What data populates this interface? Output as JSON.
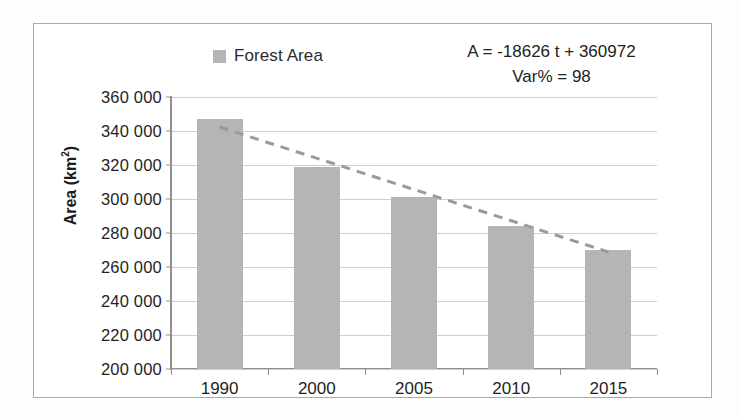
{
  "chart_data": {
    "type": "bar",
    "title": "",
    "xlabel": "",
    "ylabel": "Area (km²)",
    "categories": [
      "1990",
      "2000",
      "2005",
      "2010",
      "2015"
    ],
    "series": [
      {
        "name": "Forest Area",
        "values": [
          347000,
          319000,
          301000,
          284000,
          270000
        ]
      }
    ],
    "trendline": {
      "type": "linear-dashed",
      "equation": "A = -18626 t + 360972",
      "variance_label": "Var% = 98",
      "start_value": 342346,
      "end_value": 268842
    },
    "ylim": [
      200000,
      360000
    ],
    "ytick_step": 20000,
    "ytick_labels": [
      "360 000",
      "340 000",
      "320 000",
      "300 000",
      "280 000",
      "260 000",
      "240 000",
      "220 000",
      "200 000"
    ],
    "ytick_values": [
      360000,
      340000,
      320000,
      300000,
      280000,
      260000,
      240000,
      220000,
      200000
    ],
    "grid": true,
    "legend": {
      "position": "top-center-left",
      "entries": [
        {
          "label": "Forest Area",
          "color": "#b5b5b5",
          "marker": "square"
        }
      ]
    },
    "annotations": [
      "A = -18626 t + 360972",
      "Var% = 98"
    ]
  },
  "colors": {
    "bar_fill": "#b5b5b5",
    "trendline": "#9a9a9a",
    "gridline": "#cfcfcf",
    "axis": "#8f8f8f",
    "frame_border": "#a9a9a9",
    "text": "#1f1f1f",
    "background": "#ffffff"
  },
  "legend": {
    "label": "Forest Area"
  },
  "annotations": {
    "equation": "A = -18626 t + 360972",
    "variance": "Var% = 98"
  },
  "axis": {
    "y_title_text": "Area (km",
    "y_title_sup": "2",
    "y_title_close": ")"
  }
}
